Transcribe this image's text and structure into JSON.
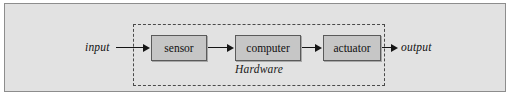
{
  "figure": {
    "background_color": "#e2e2e2",
    "panel_border_color": "#8d8d8d"
  },
  "diagram": {
    "type": "flow",
    "orientation": "left-to-right",
    "enclosure": {
      "label": "Hardware",
      "style": "dashed",
      "border_color": "#4a4a4a",
      "contains": [
        "sensor",
        "computer",
        "actuator"
      ]
    },
    "nodes": [
      {
        "id": "sensor",
        "label": "sensor",
        "shape": "rectangle",
        "fill": "#c6c6c6",
        "border": "#5a5a5a"
      },
      {
        "id": "computer",
        "label": "computer",
        "shape": "rectangle",
        "fill": "#c6c6c6",
        "border": "#5a5a5a"
      },
      {
        "id": "actuator",
        "label": "actuator",
        "shape": "rectangle",
        "fill": "#c6c6c6",
        "border": "#5a5a5a"
      }
    ],
    "terminals": [
      {
        "id": "input",
        "label": "input",
        "position": "left",
        "style": "italic"
      },
      {
        "id": "output",
        "label": "output",
        "position": "right",
        "style": "italic"
      }
    ],
    "edges": [
      {
        "from": "input",
        "to": "sensor",
        "arrow": "filled-triangle"
      },
      {
        "from": "sensor",
        "to": "computer",
        "arrow": "filled-triangle"
      },
      {
        "from": "computer",
        "to": "actuator",
        "arrow": "filled-triangle"
      },
      {
        "from": "actuator",
        "to": "output",
        "arrow": "filled-triangle"
      }
    ]
  }
}
